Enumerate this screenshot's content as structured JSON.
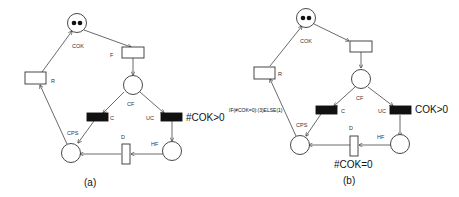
{
  "figures": [
    {
      "id": "a",
      "caption": "(a)",
      "places": [
        {
          "name": "COK",
          "tokens": 2
        },
        {
          "name": "CF",
          "tokens": 0
        },
        {
          "name": "CPS",
          "tokens": 0
        },
        {
          "name": "HF",
          "tokens": 0
        }
      ],
      "transitions": [
        {
          "name": "F",
          "type": "timed"
        },
        {
          "name": "R",
          "type": "timed"
        },
        {
          "name": "C",
          "type": "immediate"
        },
        {
          "name": "UC",
          "type": "immediate",
          "guard": "#COK>0"
        },
        {
          "name": "D",
          "type": "timed"
        }
      ],
      "labels": {
        "cok": "COK",
        "f": "F",
        "r": "R",
        "cf": "CF",
        "c": "C",
        "uc": "UC",
        "cps": "CPS",
        "d": "D",
        "hf": "HF",
        "uc_guard": "#COK>0"
      }
    },
    {
      "id": "b",
      "caption": "(b)",
      "places": [
        {
          "name": "COK",
          "tokens": 2
        },
        {
          "name": "CF",
          "tokens": 0
        },
        {
          "name": "CPS",
          "tokens": 0
        },
        {
          "name": "HF",
          "tokens": 0
        }
      ],
      "transitions": [
        {
          "name": "F",
          "type": "timed"
        },
        {
          "name": "R",
          "type": "timed"
        },
        {
          "name": "C",
          "type": "immediate"
        },
        {
          "name": "UC",
          "type": "immediate",
          "guard": "COK>0"
        },
        {
          "name": "D",
          "type": "timed",
          "guard": "#COK=0"
        }
      ],
      "labels": {
        "cok": "COK",
        "r": "R",
        "cf": "CF",
        "c": "C",
        "uc": "UC",
        "cps": "CPS",
        "d": "D",
        "hf": "HF",
        "uc_guard": "COK>0",
        "d_guard": "#COK=0",
        "arc_weight": "IF(#COK=0):(3)ELSE(1)"
      }
    }
  ]
}
